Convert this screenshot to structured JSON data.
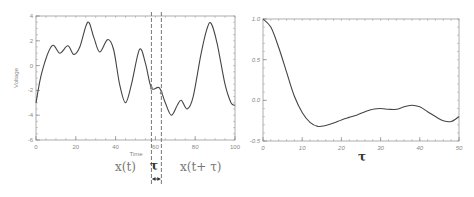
{
  "chart_data": [
    {
      "type": "line",
      "title": "",
      "xlabel": "Time",
      "ylabel": "Voltage",
      "xlim": [
        0,
        100
      ],
      "ylim": [
        -6,
        4
      ],
      "xticks": [
        "0",
        "20",
        "40",
        "60",
        "80",
        "100"
      ],
      "yticks": [
        "4",
        "2",
        "0",
        "-2",
        "-4",
        "-6"
      ],
      "grid": false,
      "series": [
        {
          "name": "x(t)",
          "x": [
            0,
            3,
            8,
            12,
            16,
            19,
            22,
            26,
            29,
            32,
            36,
            39,
            42,
            45,
            48,
            52,
            55,
            58,
            62,
            65,
            68,
            71,
            73,
            76,
            79,
            83,
            86,
            88,
            91,
            95,
            98,
            100
          ],
          "y": [
            -3.0,
            -0.5,
            1.6,
            1.0,
            1.6,
            0.9,
            1.5,
            3.5,
            2.3,
            1.1,
            2.1,
            1.3,
            -1.5,
            -3.0,
            -1.5,
            1.3,
            0.2,
            -1.8,
            -1.8,
            -3.0,
            -4.0,
            -3.2,
            -2.8,
            -3.5,
            -2.5,
            1.0,
            3.0,
            3.4,
            1.8,
            -1.5,
            -3.0,
            -3.2
          ]
        }
      ],
      "annotations": {
        "window_start": 58,
        "window_end": 63,
        "left_label": "x(t)",
        "tau_label": "τ",
        "right_label": "x(t+ τ)"
      }
    },
    {
      "type": "line",
      "title": "",
      "xlabel": "τ",
      "ylabel": "",
      "xlim": [
        0,
        50
      ],
      "ylim": [
        -0.5,
        1.0
      ],
      "xticks": [
        "0",
        "10",
        "20",
        "30",
        "40",
        "50"
      ],
      "yticks": [
        "1.0",
        "0.5",
        "0.0",
        "-0.5"
      ],
      "grid": false,
      "series": [
        {
          "name": "autocorrelation",
          "x": [
            0,
            2,
            4,
            6,
            8,
            10,
            12,
            14,
            16,
            18,
            20,
            22,
            24,
            26,
            28,
            30,
            32,
            34,
            36,
            38,
            40,
            42,
            44,
            46,
            48,
            50
          ],
          "y": [
            1.0,
            0.9,
            0.65,
            0.35,
            0.05,
            -0.15,
            -0.27,
            -0.32,
            -0.31,
            -0.28,
            -0.24,
            -0.21,
            -0.18,
            -0.14,
            -0.11,
            -0.1,
            -0.11,
            -0.11,
            -0.08,
            -0.06,
            -0.08,
            -0.14,
            -0.2,
            -0.25,
            -0.26,
            -0.2
          ]
        }
      ]
    }
  ]
}
